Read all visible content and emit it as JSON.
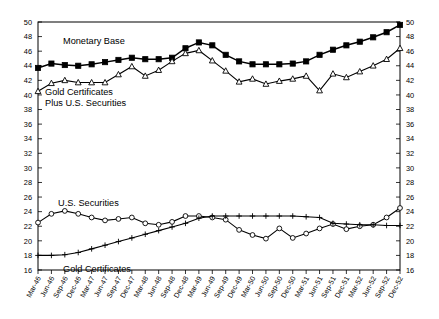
{
  "chart_data": {
    "type": "line",
    "title": "",
    "xlabel": "",
    "ylabel": "",
    "ylim": [
      16,
      50
    ],
    "ytick_step": 2,
    "grid": false,
    "legend_position": "inline-annotations",
    "axis_color": "#000000",
    "background_color": "#ffffff",
    "dual_y_axis": true,
    "yticks": [
      16,
      18,
      20,
      22,
      24,
      26,
      28,
      30,
      32,
      34,
      36,
      38,
      40,
      42,
      44,
      46,
      48,
      50
    ],
    "categories": [
      "Mar-46",
      "Jun-46",
      "Sep-46",
      "Dec-46",
      "Mar-47",
      "Jun-47",
      "Sep-47",
      "Dec-47",
      "Mar-48",
      "Jun-48",
      "Sep-48",
      "Dec-48",
      "Mar-49",
      "Jun-49",
      "Sep-49",
      "Dec-49",
      "Mar-50",
      "Jun-50",
      "Sep-50",
      "Dec-50",
      "Mar-51",
      "Jun-51",
      "Sep-51",
      "Dec-51",
      "Mar-52",
      "Jun-52",
      "Sep-52",
      "Dec-52"
    ],
    "series": [
      {
        "name": "Monetary Base",
        "marker": "filled-square",
        "label_text": "Monetary Base",
        "values": [
          43.7,
          44.3,
          44.1,
          44.0,
          44.2,
          44.5,
          44.8,
          45.1,
          44.9,
          44.9,
          45.1,
          46.4,
          47.2,
          46.8,
          45.5,
          44.6,
          44.2,
          44.2,
          44.2,
          44.3,
          44.6,
          45.5,
          46.2,
          46.8,
          47.3,
          47.9,
          48.6,
          49.6
        ]
      },
      {
        "name": "Gold Certificates Plus U.S. Securities",
        "marker": "open-triangle",
        "label_text": "Gold Certificates\nPlus U.S. Securities",
        "values": [
          40.5,
          41.6,
          42.0,
          41.7,
          41.7,
          41.7,
          42.8,
          43.9,
          42.6,
          43.4,
          44.6,
          45.7,
          46.1,
          44.7,
          43.3,
          41.8,
          42.2,
          41.5,
          41.9,
          42.2,
          42.6,
          40.6,
          42.9,
          42.4,
          43.2,
          44.0,
          44.9,
          46.4
        ]
      },
      {
        "name": "U.S. Securities",
        "marker": "open-circle",
        "label_text": "U.S. Securities",
        "values": [
          22.5,
          23.7,
          24.1,
          23.7,
          23.2,
          22.8,
          23.0,
          23.2,
          22.4,
          22.2,
          22.6,
          23.4,
          23.4,
          23.2,
          22.9,
          21.5,
          20.8,
          20.3,
          21.7,
          20.4,
          21.0,
          21.7,
          22.3,
          21.6,
          22.0,
          22.2,
          23.2,
          24.5
        ]
      },
      {
        "name": "Gold Certificates",
        "marker": "plus",
        "label_text": "Gold Certificates",
        "values": [
          18.0,
          18.0,
          18.1,
          18.4,
          18.9,
          19.4,
          19.9,
          20.4,
          20.9,
          21.4,
          21.9,
          22.4,
          23.1,
          23.4,
          23.4,
          23.4,
          23.4,
          23.4,
          23.4,
          23.4,
          23.3,
          23.2,
          22.4,
          22.3,
          22.2,
          22.2,
          22.1,
          22.1
        ]
      }
    ],
    "annotations": [
      {
        "text": "Monetary Base",
        "x_px": 63,
        "y_px": 44
      },
      {
        "text": "Gold Certificates",
        "x_px": 45,
        "y_px": 95
      },
      {
        "text": "Plus U.S. Securities",
        "x_px": 45,
        "y_px": 106
      },
      {
        "text": "U.S. Securities",
        "x_px": 58,
        "y_px": 206
      },
      {
        "text": "Gold Certificates",
        "x_px": 63,
        "y_px": 272
      }
    ]
  }
}
